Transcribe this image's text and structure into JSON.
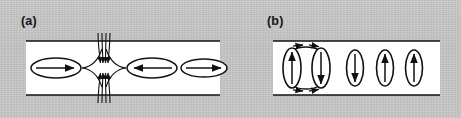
{
  "figure": {
    "background_color": "#c8c8c8",
    "panel_fill_color": "#ffffff",
    "ink_color": "#111111",
    "type": "physics-schematic"
  },
  "panels": [
    {
      "id": "a",
      "label": "(a)",
      "orientation": "horizontal-flux-tubes",
      "box": {
        "x": 8,
        "y": 8,
        "width": 194,
        "height": 54
      },
      "border_edges": [
        "top",
        "bottom"
      ],
      "features": {
        "x_point": {
          "name": "reconnection-x-point",
          "center_x": 86,
          "center_y": 35,
          "inflow_arrow_count": 8,
          "inflow_direction": "vertical-inward",
          "separatrix_count": 4
        },
        "ellipses": [
          {
            "name": "flux-tube-left",
            "cx": 38,
            "cy": 35,
            "rx": 25,
            "ry": 10,
            "arrow": "right"
          },
          {
            "name": "flux-tube-middle",
            "cx": 134,
            "cy": 35,
            "rx": 25,
            "ry": 10,
            "arrow": "left"
          },
          {
            "name": "flux-tube-right",
            "cx": 186,
            "cy": 35,
            "rx": 23,
            "ry": 9,
            "arrow": "right"
          }
        ]
      }
    },
    {
      "id": "b",
      "label": "(b)",
      "orientation": "vertical-flux-tubes",
      "box": {
        "x": 8,
        "y": 8,
        "width": 167,
        "height": 54
      },
      "border_edges": [
        "top",
        "bottom"
      ],
      "features": {
        "circulation": {
          "name": "circulation-loop",
          "cx": 41,
          "cy": 35,
          "arc_arrow_top": "right",
          "arc_arrow_bottom": "right",
          "arrowheads": 4
        },
        "ellipses": [
          {
            "name": "flux-tube-1",
            "cx": 27,
            "cy": 35,
            "rx": 9,
            "ry": 20,
            "arrow": "up",
            "paired": true
          },
          {
            "name": "flux-tube-2",
            "cx": 56,
            "cy": 35,
            "rx": 9,
            "ry": 20,
            "arrow": "down",
            "paired": true
          },
          {
            "name": "flux-tube-3",
            "cx": 90,
            "cy": 35,
            "rx": 8.5,
            "ry": 18,
            "arrow": "down",
            "paired": false
          },
          {
            "name": "flux-tube-4",
            "cx": 120,
            "cy": 35,
            "rx": 8.5,
            "ry": 18,
            "arrow": "up",
            "paired": false
          },
          {
            "name": "flux-tube-5",
            "cx": 149,
            "cy": 35,
            "rx": 8.5,
            "ry": 18,
            "arrow": "up",
            "paired": false
          }
        ]
      }
    }
  ]
}
